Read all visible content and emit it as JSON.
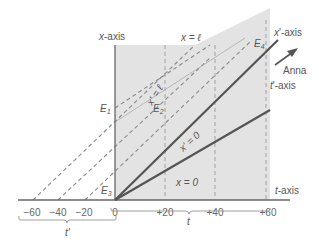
{
  "diagram": {
    "type": "spacetime-diagram",
    "axes": {
      "x_axis_label": "x-axis",
      "t_axis_label": "t-axis",
      "x_prime_axis_label": "x'-axis",
      "t_prime_axis_label": "t'-axis"
    },
    "lines": {
      "x_equals_l": "x = ℓ",
      "x_prime_equals_l": "x' = ℓ",
      "x_prime_equals_0": "x' = 0",
      "x_equals_0": "x = 0"
    },
    "events": [
      "E1",
      "E2",
      "E3",
      "E4"
    ],
    "observer": {
      "label": "Anna",
      "arrow": "arrow-up-right-icon"
    },
    "ticks": [
      "−60",
      "−40",
      "−20",
      "0",
      "+20",
      "+40",
      "+60"
    ],
    "braces": {
      "t_prime": "t'",
      "t": "t"
    },
    "colors": {
      "shade": "#e3e3e3",
      "axis": "#666666",
      "thick_line": "#555555",
      "dashed": "#8a8a8a",
      "text": "#555555"
    }
  }
}
